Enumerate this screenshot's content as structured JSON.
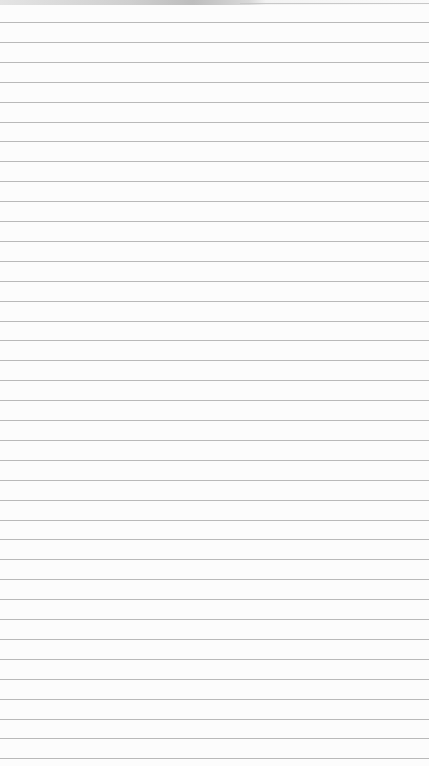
{
  "paper": {
    "type": "lined-paper",
    "background_color": "#fcfcfc",
    "line_color": "#b9b9b9",
    "first_line_y": 22,
    "line_spacing": 19.9,
    "line_count": 38
  }
}
